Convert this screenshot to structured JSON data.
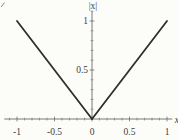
{
  "figure": {
    "background": "#fcfcf9",
    "axis_color": "#6b6b6b",
    "curve_color": "#2e2e2e",
    "label_color": "#3c3c3c"
  },
  "chart_data": {
    "type": "line",
    "title": "",
    "xlabel": "x",
    "ylabel": "|x|",
    "xlim": [
      -1.17,
      1.07
    ],
    "ylim": [
      0,
      1.1
    ],
    "grid": false,
    "legend": false,
    "x_ticks": {
      "major": [
        -1,
        -0.5,
        0,
        0.5,
        1
      ],
      "major_labels": [
        "-1",
        "-0.5",
        "0",
        "0.5",
        "1"
      ],
      "minor_step": 0.1
    },
    "y_ticks": {
      "major": [
        0.5,
        1
      ],
      "major_labels": [
        "0.5",
        "1"
      ],
      "minor_step": 0.1
    },
    "series": [
      {
        "name": "abs-left-branch",
        "x": [
          -1,
          0
        ],
        "y": [
          1,
          0
        ]
      },
      {
        "name": "abs-right-branch",
        "x": [
          0,
          1
        ],
        "y": [
          0,
          1
        ]
      }
    ]
  }
}
